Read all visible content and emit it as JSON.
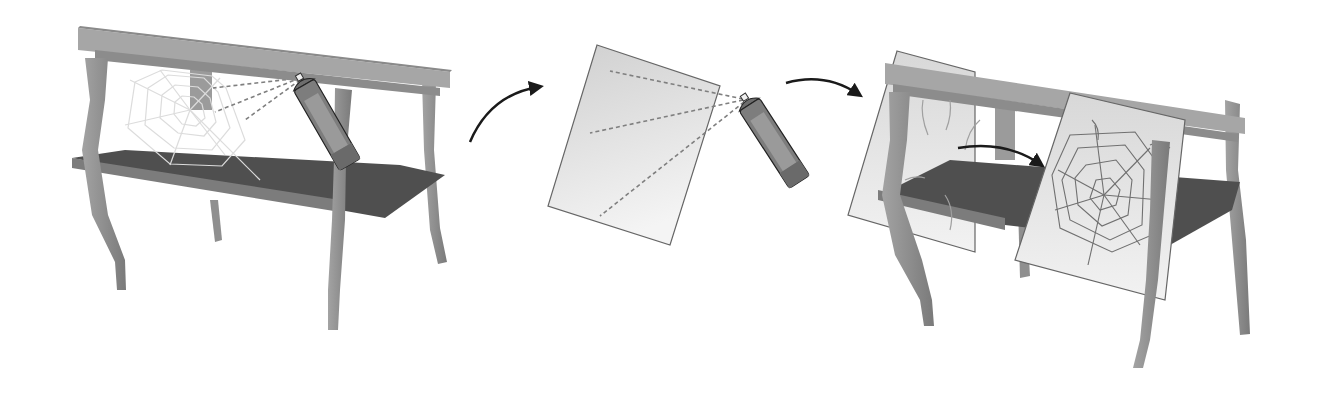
{
  "figure": {
    "type": "instructional-illustration",
    "steps": [
      {
        "id": "step-1",
        "subject": "spider web on table",
        "action": "spray web with spray can",
        "caption": ""
      },
      {
        "id": "step-2",
        "subject": "sheet of paper",
        "action": "spray paper with spray can",
        "caption": ""
      },
      {
        "id": "step-3",
        "subject": "paper pressed to web on table",
        "action": "lift web onto paper",
        "caption": ""
      }
    ],
    "arrows": [
      {
        "from": "step-1",
        "to": "step-2",
        "icon": "curved-arrow-icon"
      },
      {
        "from": "step-2",
        "to": "step-3",
        "icon": "curved-arrow-icon"
      },
      {
        "from": "web",
        "to": "paper",
        "icon": "curved-arrow-icon"
      }
    ],
    "colors": {
      "background": "#ffffff",
      "table_top": "#9a9a9a",
      "table_shelf": "#4d4d4d",
      "table_leg": "#8c8c8c",
      "web": "#d9d9d9",
      "web_on_paper": "#707070",
      "paper": "#e9e9e9",
      "paper_edge": "#666666",
      "can_body": "#7a7a7a",
      "spray_line": "#7f7f7f",
      "arrow": "#1a1a1a"
    }
  }
}
